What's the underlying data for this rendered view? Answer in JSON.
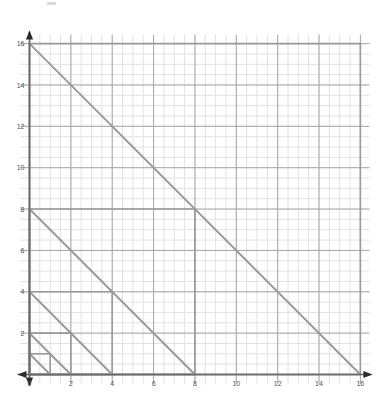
{
  "figure": {
    "title": "",
    "background": "#ffffff"
  },
  "chart_data": {
    "type": "line",
    "title": "",
    "xlabel": "",
    "ylabel": "",
    "xlim": [
      0,
      16
    ],
    "ylim": [
      0,
      16
    ],
    "grid": true,
    "minor_grid": true,
    "minor_step": 0.5,
    "major_step": 2,
    "legend": "none",
    "axis_arrows": [
      "x-positive",
      "x-negative",
      "y-positive",
      "y-negative"
    ],
    "xticks": [
      0,
      2,
      4,
      6,
      8,
      10,
      12,
      14,
      16
    ],
    "xticklabels": [
      "0",
      "2",
      "4",
      "6",
      "8",
      "10",
      "12",
      "14",
      "16"
    ],
    "yticks": [
      0,
      2,
      4,
      6,
      8,
      10,
      12,
      14,
      16
    ],
    "yticklabels": [
      "0",
      "2",
      "4",
      "6",
      "8",
      "10",
      "12",
      "14",
      "16"
    ],
    "series": [
      {
        "name": "triangle-16",
        "size": 16,
        "type": "right-triangle",
        "points": [
          [
            0,
            16
          ],
          [
            16,
            0
          ],
          [
            0,
            0
          ]
        ],
        "hypotenuse": {
          "from": [
            0,
            16
          ],
          "to": [
            16,
            0
          ],
          "equation": "y = 16 - x"
        },
        "color": "#9a9a9a"
      },
      {
        "name": "triangle-8",
        "size": 8,
        "type": "right-triangle",
        "points": [
          [
            0,
            8
          ],
          [
            8,
            0
          ],
          [
            0,
            0
          ]
        ],
        "hypotenuse": {
          "from": [
            0,
            8
          ],
          "to": [
            8,
            0
          ],
          "equation": "y = 8 - x"
        },
        "color": "#9a9a9a"
      },
      {
        "name": "triangle-4",
        "size": 4,
        "type": "right-triangle",
        "points": [
          [
            0,
            4
          ],
          [
            4,
            0
          ],
          [
            0,
            0
          ]
        ],
        "hypotenuse": {
          "from": [
            0,
            4
          ],
          "to": [
            4,
            0
          ],
          "equation": "y = 4 - x"
        },
        "color": "#9a9a9a"
      },
      {
        "name": "triangle-2",
        "size": 2,
        "type": "right-triangle",
        "points": [
          [
            0,
            2
          ],
          [
            2,
            0
          ],
          [
            0,
            0
          ]
        ],
        "hypotenuse": {
          "from": [
            0,
            2
          ],
          "to": [
            2,
            0
          ],
          "equation": "y = 2 - x"
        },
        "color": "#9a9a9a"
      },
      {
        "name": "triangle-1",
        "size": 1,
        "type": "right-triangle",
        "points": [
          [
            0,
            1
          ],
          [
            1,
            0
          ],
          [
            0,
            0
          ]
        ],
        "hypotenuse": {
          "from": [
            0,
            1
          ],
          "to": [
            1,
            0
          ],
          "equation": "y = 1 - x"
        },
        "color": "#9a9a9a"
      }
    ],
    "colors": {
      "line": "#9a9a9a",
      "axis": "#6b6b6b",
      "major_grid": "#a8a8a8",
      "minor_grid": "#e2e2e2",
      "tick_label": "#555555",
      "background": "#ffffff"
    }
  }
}
